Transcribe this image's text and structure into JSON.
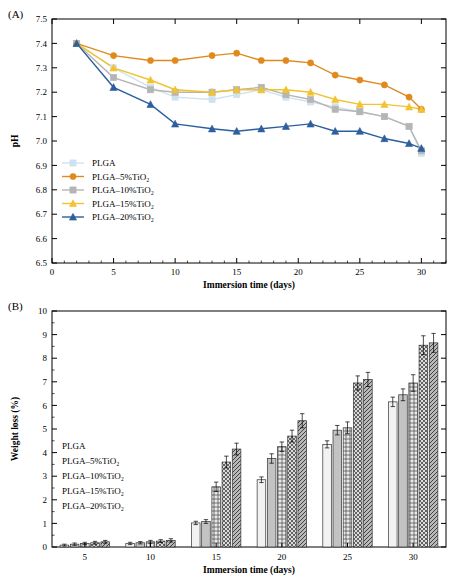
{
  "panels": {
    "a_label": "(A)",
    "b_label": "(B)"
  },
  "chart_data": [
    {
      "type": "line",
      "panel": "(A)",
      "title": "",
      "xlabel": "Immersion time (days)",
      "ylabel": "pH",
      "xlim": [
        0,
        32
      ],
      "ylim": [
        6.5,
        7.5
      ],
      "xticks": [
        0,
        5,
        10,
        15,
        20,
        25,
        30
      ],
      "yticks": [
        "6.5",
        "6.6",
        "6.7",
        "6.8",
        "6.9",
        "7.0",
        "7.1",
        "7.2",
        "7.3",
        "7.4",
        "7.5"
      ],
      "grid": false,
      "legend_position": "lower-left-inside",
      "x": [
        2,
        5,
        8,
        10,
        13,
        15,
        17,
        19,
        21,
        23,
        25,
        27,
        29,
        30
      ],
      "series": [
        {
          "name": "PLGA",
          "color": "#cfe2ef",
          "marker": "square",
          "values": [
            7.4,
            7.3,
            7.22,
            7.18,
            7.17,
            7.19,
            7.21,
            7.18,
            7.16,
            7.14,
            7.12,
            7.1,
            7.06,
            6.95
          ]
        },
        {
          "name": "PLGA–5%TiO₂",
          "color": "#e08a1e",
          "marker": "circle",
          "values": [
            7.4,
            7.35,
            7.33,
            7.33,
            7.35,
            7.36,
            7.33,
            7.33,
            7.32,
            7.27,
            7.25,
            7.23,
            7.18,
            7.13
          ]
        },
        {
          "name": "PLGA–10%TiO₂",
          "color": "#b5b5b5",
          "marker": "square",
          "values": [
            7.4,
            7.26,
            7.21,
            7.2,
            7.2,
            7.21,
            7.22,
            7.19,
            7.17,
            7.13,
            7.12,
            7.1,
            7.06,
            6.96
          ]
        },
        {
          "name": "PLGA–15%TiO₂",
          "color": "#f2c230",
          "marker": "triangle-up",
          "values": [
            7.4,
            7.3,
            7.25,
            7.21,
            7.2,
            7.21,
            7.21,
            7.21,
            7.2,
            7.17,
            7.15,
            7.15,
            7.14,
            7.13
          ]
        },
        {
          "name": "PLGA–20%TiO₂",
          "color": "#2c5f9e",
          "marker": "triangle-up",
          "values": [
            7.4,
            7.22,
            7.15,
            7.07,
            7.05,
            7.04,
            7.05,
            7.06,
            7.07,
            7.04,
            7.04,
            7.01,
            6.99,
            6.97
          ]
        }
      ]
    },
    {
      "type": "bar",
      "panel": "(B)",
      "title": "",
      "xlabel": "Immersion time (days)",
      "ylabel": "Weight loss (%)",
      "categories": [
        "5",
        "10",
        "15",
        "20",
        "25",
        "30"
      ],
      "ylim": [
        0,
        10
      ],
      "yticks": [
        "0",
        "1",
        "2",
        "3",
        "4",
        "5",
        "6",
        "7",
        "8",
        "9",
        "10"
      ],
      "grid": false,
      "legend_position": "left-inside",
      "series": [
        {
          "name": "PLGA",
          "pattern": "solid-light",
          "values": [
            0.08,
            0.15,
            1.02,
            2.85,
            4.35,
            6.15
          ],
          "errors": [
            0.04,
            0.05,
            0.07,
            0.12,
            0.15,
            0.2
          ]
        },
        {
          "name": "PLGA–5%TiO₂",
          "pattern": "vertical-lines",
          "values": [
            0.12,
            0.18,
            1.08,
            3.75,
            4.95,
            6.45
          ],
          "errors": [
            0.05,
            0.05,
            0.08,
            0.2,
            0.2,
            0.25
          ]
        },
        {
          "name": "PLGA–10%TiO₂",
          "pattern": "grid",
          "values": [
            0.15,
            0.22,
            2.55,
            4.25,
            5.05,
            6.95
          ],
          "errors": [
            0.05,
            0.06,
            0.2,
            0.2,
            0.25,
            0.35
          ]
        },
        {
          "name": "PLGA–15%TiO₂",
          "pattern": "cross-hatch",
          "values": [
            0.18,
            0.25,
            3.6,
            4.7,
            6.95,
            8.55
          ],
          "errors": [
            0.06,
            0.06,
            0.25,
            0.25,
            0.3,
            0.4
          ]
        },
        {
          "name": "PLGA–20%TiO₂",
          "pattern": "diagonal-hatch",
          "values": [
            0.22,
            0.28,
            4.15,
            5.35,
            7.1,
            8.65
          ],
          "errors": [
            0.06,
            0.07,
            0.25,
            0.3,
            0.3,
            0.4
          ]
        }
      ]
    }
  ]
}
